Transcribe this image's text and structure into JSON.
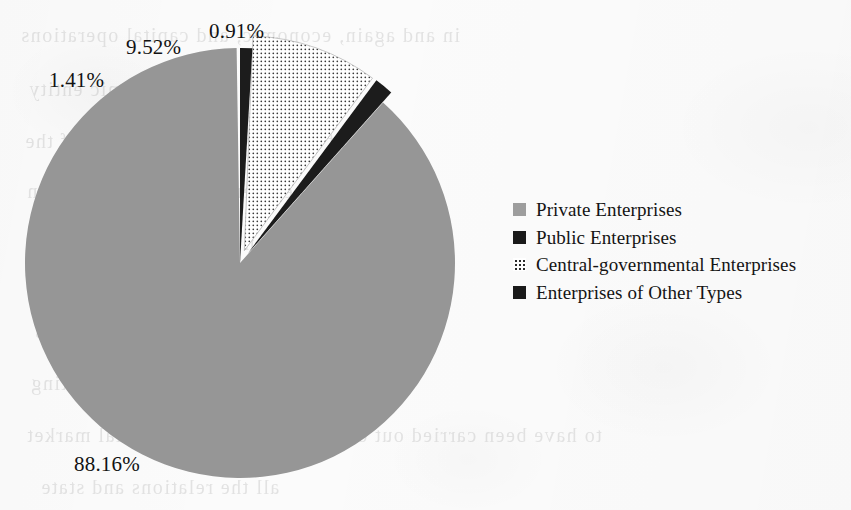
{
  "page": {
    "background_color": "#fbfbfb",
    "width": 851,
    "height": 510,
    "media": "scanned-book-page"
  },
  "ghost_text": {
    "note": "faint mirrored bleed-through from the reverse side of the scanned page",
    "lines": [
      {
        "text": "in and again, economic, and capital operations",
        "x": 20,
        "y": 24,
        "size": 20
      },
      {
        "text": "economic. In some economic entity",
        "x": 28,
        "y": 78,
        "size": 20
      },
      {
        "text": "terms of both have the hypothesis of the",
        "x": 24,
        "y": 130,
        "size": 20
      },
      {
        "text": "to evidence so does not to it in",
        "x": 26,
        "y": 180,
        "size": 20
      },
      {
        "text": "in the decision of economic policy in",
        "x": 30,
        "y": 232,
        "size": 20
      },
      {
        "text": "financing the firm's assets",
        "x": 34,
        "y": 320,
        "size": 20
      },
      {
        "text": "use debt, the operations competing",
        "x": 30,
        "y": 372,
        "size": 20
      },
      {
        "text": "to have been carried out on the provision of financial market",
        "x": 26,
        "y": 424,
        "size": 20
      },
      {
        "text": "all the relations and state",
        "x": 40,
        "y": 476,
        "size": 20
      }
    ]
  },
  "chart_data": {
    "type": "pie",
    "title": "",
    "categories": [
      "Private Enterprises",
      "Public Enterprises",
      "Central-governmental Enterprises",
      "Enterprises of Other Types"
    ],
    "values": [
      88.16,
      1.41,
      9.52,
      0.91
    ],
    "value_labels": [
      "88.16%",
      "1.41%",
      "9.52%",
      "0.91%"
    ],
    "unit": "percent",
    "legend_position": "right",
    "grid": false,
    "slices": [
      {
        "label": "Private Enterprises",
        "value": 88.16,
        "value_label": "88.16%",
        "fill_style": "solid",
        "color": "#969696",
        "exploded": false,
        "start_angle_deg": 41.7,
        "sweep_deg": 317.4,
        "label_x": 74,
        "label_y": 452
      },
      {
        "label": "Public Enterprises",
        "value": 1.41,
        "value_label": "1.41%",
        "fill_style": "solid",
        "color": "#1a1a1a",
        "exploded": true,
        "start_angle_deg": 36.6,
        "sweep_deg": 5.1,
        "label_x": 49,
        "label_y": 68
      },
      {
        "label": "Central-governmental Enterprises",
        "value": 9.52,
        "value_label": "9.52%",
        "fill_style": "dotted",
        "color": "#2b2b2b",
        "exploded": true,
        "start_angle_deg": 2.3,
        "sweep_deg": 34.3,
        "label_x": 126,
        "label_y": 35
      },
      {
        "label": "Enterprises of Other Types",
        "value": 0.91,
        "value_label": "0.91%",
        "fill_style": "solid",
        "color": "#1a1a1a",
        "exploded": false,
        "start_angle_deg": 0.0,
        "sweep_deg": 3.3,
        "label_x": 209,
        "label_y": 19
      }
    ],
    "geometry": {
      "center_x": 240,
      "center_y": 263,
      "radius": 215
    }
  },
  "legend": {
    "items": [
      {
        "label": "Private Enterprises",
        "swatch": "solid-gray",
        "color": "#9d9d9d"
      },
      {
        "label": "Public Enterprises",
        "swatch": "solid-black",
        "color": "#1a1a1a"
      },
      {
        "label": "Central-governmental Enterprises",
        "swatch": "dotted",
        "color": "#2b2b2b"
      },
      {
        "label": "Enterprises of Other Types",
        "swatch": "solid-black",
        "color": "#1a1a1a"
      }
    ]
  }
}
